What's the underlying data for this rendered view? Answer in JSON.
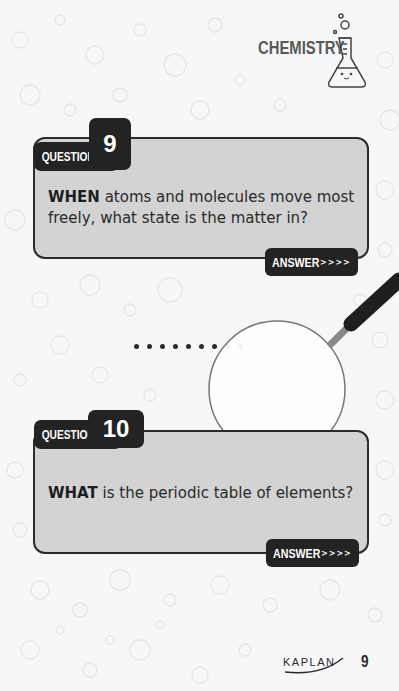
{
  "header": {
    "section_title": "CHEMISTRY",
    "icon": "flask-icon"
  },
  "questions": [
    {
      "label": "QUESTION",
      "number": "9",
      "lead_word": "WHEN",
      "text": " atoms and molecules move most freely, what state is the matter in?",
      "answer_label": "ANSWER",
      "answer_arrows": ">>>>"
    },
    {
      "label": "QUESTION",
      "number": "10",
      "lead_word": "WHAT",
      "text": " is the periodic table of elements?",
      "answer_label": "ANSWER",
      "answer_arrows": ">>>>"
    }
  ],
  "decoration": {
    "magnifier_icon": "magnifying-glass-icon",
    "dots_count": 9
  },
  "footer": {
    "publisher": "KAPLAN",
    "page_number": "9"
  },
  "colors": {
    "background": "#f7f7f7",
    "card": "#d3d3d3",
    "dark": "#232323",
    "title_gray": "#595959"
  }
}
